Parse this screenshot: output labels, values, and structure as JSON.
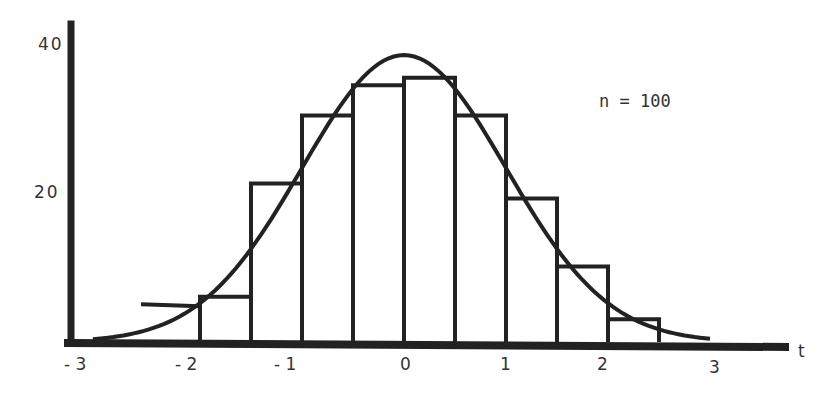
{
  "chart_data": {
    "type": "bar",
    "subtype": "histogram_with_density_curve",
    "title": "",
    "xlabel": "t",
    "ylabel": "",
    "annotation": "n = 100",
    "x_ticks": [
      "-3",
      "-2",
      "-1",
      "0",
      "1",
      "2",
      "3"
    ],
    "y_ticks": [
      "20",
      "40"
    ],
    "xlim": [
      -3.3,
      3.6
    ],
    "ylim": [
      0,
      45
    ],
    "grid": false,
    "legend": null,
    "bin_width": 0.5,
    "bins": [
      {
        "from": -2.5,
        "to": -2.0,
        "count": 5
      },
      {
        "from": -2.0,
        "to": -1.5,
        "count": 6
      },
      {
        "from": -1.5,
        "to": -1.0,
        "count": 21
      },
      {
        "from": -1.0,
        "to": -0.5,
        "count": 30
      },
      {
        "from": -0.5,
        "to": 0.0,
        "count": 34
      },
      {
        "from": 0.0,
        "to": 0.5,
        "count": 35
      },
      {
        "from": 0.5,
        "to": 1.0,
        "count": 30
      },
      {
        "from": 1.0,
        "to": 1.5,
        "count": 19
      },
      {
        "from": 1.5,
        "to": 2.0,
        "count": 10
      },
      {
        "from": 2.0,
        "to": 2.5,
        "count": 3
      }
    ],
    "categories": [
      "-2.5..-2",
      "-2..-1.5",
      "-1.5..-1",
      "-1..-0.5",
      "-0.5..0",
      "0..0.5",
      "0.5..1",
      "1..1.5",
      "1.5..2",
      "2..2.5"
    ],
    "values": [
      5,
      6,
      21,
      30,
      34,
      35,
      30,
      19,
      10,
      3
    ],
    "curve": {
      "name": "fitted density (scaled to n=100, bin width 0.5)",
      "peak_x": 0,
      "peak_y": 38,
      "x_range": [
        -3,
        3
      ]
    }
  },
  "labels": {
    "x_axis": "t",
    "annotation": "n = 100",
    "y_tick_20": "20",
    "y_tick_40": "40",
    "x_tick_m3": "- 3",
    "x_tick_m2": "- 2",
    "x_tick_m1": "- 1",
    "x_tick_0": "0",
    "x_tick_1": "1",
    "x_tick_2": "2",
    "x_tick_3": "3"
  },
  "colors": {
    "ink": "#222222",
    "text": "#333333",
    "background": "#ffffff"
  }
}
